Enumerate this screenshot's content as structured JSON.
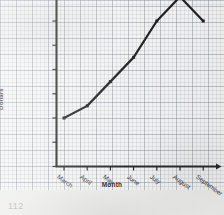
{
  "page": {
    "page_number": "112",
    "background_color": "#f6f6f4",
    "ink_color": "#222222",
    "grid_color": "#78808c"
  },
  "chart_data": {
    "type": "line",
    "title": "",
    "xlabel": "Month",
    "ylabel": "Dollars",
    "categories": [
      "March",
      "April",
      "May",
      "June",
      "July",
      "August",
      "September"
    ],
    "values": [
      400,
      500,
      700,
      900,
      1200,
      1400,
      1200
    ],
    "value_prefix": "$",
    "ylim": [
      0,
      1300
    ],
    "y_ticks": [
      0,
      200,
      400,
      600,
      800,
      1000,
      1200
    ],
    "y_tick_labels": [
      "0",
      "$200",
      "$400",
      "$600",
      "$800",
      "$1000",
      "$1200"
    ],
    "grid": true,
    "legend": "none",
    "line_color": "#222222"
  }
}
